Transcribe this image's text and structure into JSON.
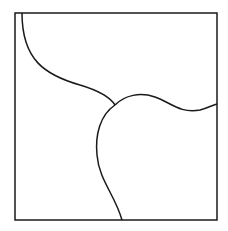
{
  "diagram": {
    "stroke_color": "#1a1a1a",
    "background_color": "#ffffff",
    "frame": {
      "x": 15,
      "y": 13,
      "width": 202,
      "height": 207
    },
    "junction": {
      "x": 115,
      "y": 105
    },
    "curves": [
      {
        "id": "top-left-curve",
        "path": "M 22 13 C 22 60, 45 75, 80 85 C 100 91, 110 97, 115 105"
      },
      {
        "id": "right-curve",
        "path": "M 115 105 C 125 95, 140 92, 155 97 C 170 102, 180 114, 200 110 C 208 108, 213 105, 217 104"
      },
      {
        "id": "bottom-curve",
        "path": "M 115 105 C 100 115, 95 135, 97 155 C 99 180, 115 195, 122 220"
      }
    ],
    "regions": [
      "top-right-region",
      "left-region",
      "bottom-right-region"
    ]
  }
}
